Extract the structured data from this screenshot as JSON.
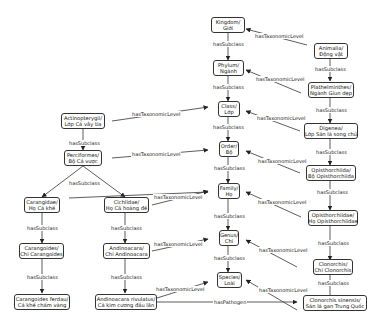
{
  "nodes": {
    "kingdom": {
      "l1": "Kingdom/",
      "l2": "Giới"
    },
    "phylum": {
      "l1": "Phylum/",
      "l2": "Ngành"
    },
    "class": {
      "l1": "Class/",
      "l2": "Lớp"
    },
    "order": {
      "l1": "Order/",
      "l2": "Bộ"
    },
    "family": {
      "l1": "Family/",
      "l2": "Họ"
    },
    "genus": {
      "l1": "Genus/",
      "l2": "Chi"
    },
    "species": {
      "l1": "Species/",
      "l2": "Loài"
    },
    "animalia": {
      "l1": "Animalia/",
      "l2": "Động vật"
    },
    "platyhelminthes": {
      "l1": "Plathelminthes/",
      "l2": "Ngành Giun dẹp"
    },
    "digenea": {
      "l1": "Digenea/",
      "l2": "Lớp Sán lá song chủ"
    },
    "opisthorchiida": {
      "l1": "Opisthorchiida/",
      "l2": "Bộ Opisthorchiida"
    },
    "opisthorchiidae": {
      "l1": "Opisthorchiidae/",
      "l2": "Họ Opisthorchiidae"
    },
    "clonorchis": {
      "l1": "Clonorchis/",
      "l2": "Chi Clonorchis"
    },
    "clonorchis_sinensis": {
      "l1": "Clonorchis sinensis/",
      "l2": "Sán lá gan Trung Quốc"
    },
    "actinopterygii": {
      "l1": "Actinopterygii/",
      "l2": "Lớp Cá vây tia"
    },
    "perciformes": {
      "l1": "Perciformes/",
      "l2": "Bộ Cá vược"
    },
    "carangidae": {
      "l1": "Carangidae/",
      "l2": "Họ Cá khế"
    },
    "cichlidae": {
      "l1": "Cichlidae/",
      "l2": "Họ Cá hoàng đế"
    },
    "carangoides": {
      "l1": "Carangoides/",
      "l2": "Chi Carangoides"
    },
    "andinoacara": {
      "l1": "Andinoacara/",
      "l2": "Chi Andinoacara"
    },
    "carangoides_ferdau": {
      "l1": "Carangoides ferdau/",
      "l2": "Cá khế chấm vàng"
    },
    "andinoacara_rivulatus": {
      "l1": "Andinoacara rivulatus/",
      "l2": "Cá kim cương đầu lân"
    }
  },
  "edge_labels": {
    "has_subclass": "hasSubclass",
    "has_taxonomic_level": "hasTaxonomicLevel",
    "has_pathogen": "hasPathogen"
  }
}
